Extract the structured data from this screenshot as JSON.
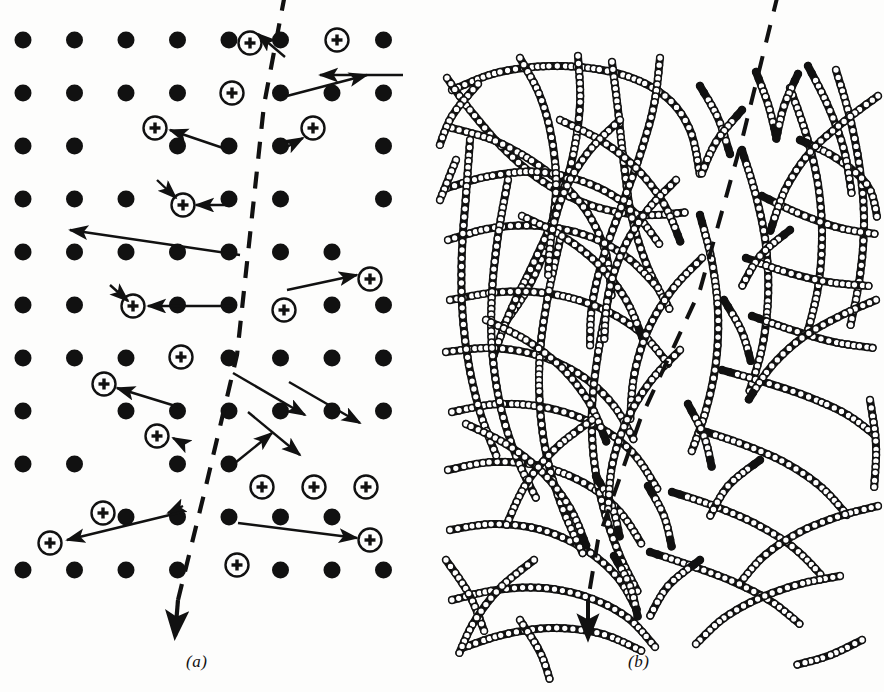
{
  "figure": {
    "background_color": "#fdfdfc",
    "ink_color": "#111111",
    "width": 884,
    "height": 692
  },
  "panels": [
    {
      "id": "a",
      "caption": "(a)",
      "caption_x": 186,
      "caption_y": 652,
      "kind": "crystalline-lattice",
      "description": "Regular square lattice of filled atoms, with circled-plus defect atoms and displacement arrows, bisected by a dashed crack line",
      "lattice": {
        "origin_x": 23,
        "origin_y": 40,
        "spacing_x": 51.5,
        "spacing_y": 53.0,
        "cols": 8,
        "rows": 11,
        "dot_radius": 8.5,
        "dot_fill": "#111111",
        "row_offsets": [
          0,
          0,
          0,
          0,
          0,
          0,
          0,
          0,
          0,
          0,
          0
        ]
      },
      "defect_symbol": {
        "name": "circled-plus",
        "outer_radius": 11.5,
        "stroke_width": 2.4,
        "inner_plus_arm": 5.5,
        "inner_plus_width": 3.4
      },
      "defects": [
        {
          "col": 6,
          "row": 0,
          "x": 337,
          "y": 40
        },
        {
          "col": 4,
          "row": 1,
          "x": 232,
          "y": 93
        },
        {
          "col": 2,
          "row": 2,
          "x": 155,
          "y": 128
        },
        {
          "col": 6,
          "row": 2,
          "x": 313,
          "y": 128
        },
        {
          "col": 3,
          "row": 3,
          "x": 183,
          "y": 205
        },
        {
          "col": 7,
          "row": 4,
          "x": 370,
          "y": 279
        },
        {
          "col": 2,
          "row": 5,
          "x": 133,
          "y": 306
        },
        {
          "col": 5,
          "row": 5,
          "x": 284,
          "y": 310
        },
        {
          "col": 3,
          "row": 6,
          "x": 181,
          "y": 357
        },
        {
          "col": 1,
          "row": 7,
          "x": 104,
          "y": 384
        },
        {
          "col": 2,
          "row": 8,
          "x": 157,
          "y": 436
        },
        {
          "col": 5,
          "row": 8,
          "x": 262,
          "y": 487
        },
        {
          "col": 6,
          "row": 8,
          "x": 314,
          "y": 487
        },
        {
          "col": 7,
          "row": 8,
          "x": 366,
          "y": 487
        },
        {
          "col": 1,
          "row": 9,
          "x": 103,
          "y": 513
        },
        {
          "col": 7,
          "row": 9,
          "x": 370,
          "y": 540
        },
        {
          "col": 0,
          "row": 9,
          "x": 50,
          "y": 543
        },
        {
          "col": 4,
          "row": 10,
          "x": 237,
          "y": 565
        },
        {
          "col": 6,
          "row": 3,
          "x": 250,
          "y": 43
        }
      ],
      "arrows": [
        {
          "x1": 285,
          "y1": 57,
          "x2": 258,
          "y2": 34,
          "label": "displacement-arrow"
        },
        {
          "x1": 403,
          "y1": 75,
          "x2": 320,
          "y2": 75,
          "label": "displacement-arrow"
        },
        {
          "x1": 283,
          "y1": 97,
          "x2": 367,
          "y2": 75,
          "label": "displacement-arrow"
        },
        {
          "x1": 226,
          "y1": 149,
          "x2": 170,
          "y2": 130,
          "label": "displacement-arrow"
        },
        {
          "x1": 285,
          "y1": 148,
          "x2": 303,
          "y2": 138,
          "label": "displacement-arrow"
        },
        {
          "x1": 232,
          "y1": 205,
          "x2": 196,
          "y2": 205,
          "label": "displacement-arrow"
        },
        {
          "x1": 157,
          "y1": 180,
          "x2": 176,
          "y2": 198,
          "label": "displacement-arrow"
        },
        {
          "x1": 240,
          "y1": 255,
          "x2": 70,
          "y2": 230,
          "label": "long-displacement-arrow"
        },
        {
          "x1": 287,
          "y1": 290,
          "x2": 357,
          "y2": 275,
          "label": "displacement-arrow"
        },
        {
          "x1": 232,
          "y1": 306,
          "x2": 148,
          "y2": 306,
          "label": "displacement-arrow"
        },
        {
          "x1": 110,
          "y1": 285,
          "x2": 128,
          "y2": 301,
          "label": "displacement-arrow"
        },
        {
          "x1": 289,
          "y1": 382,
          "x2": 360,
          "y2": 423,
          "label": "displacement-arrow"
        },
        {
          "x1": 182,
          "y1": 408,
          "x2": 117,
          "y2": 388,
          "label": "displacement-arrow"
        },
        {
          "x1": 235,
          "y1": 463,
          "x2": 272,
          "y2": 433,
          "label": "displacement-arrow"
        },
        {
          "x1": 184,
          "y1": 444,
          "x2": 173,
          "y2": 438,
          "label": "displacement-arrow"
        },
        {
          "x1": 183,
          "y1": 506,
          "x2": 168,
          "y2": 513,
          "label": "displacement-arrow"
        },
        {
          "x1": 182,
          "y1": 512,
          "x2": 67,
          "y2": 540,
          "label": "displacement-arrow"
        },
        {
          "x1": 238,
          "y1": 523,
          "x2": 357,
          "y2": 538,
          "label": "displacement-arrow"
        },
        {
          "x1": 233,
          "y1": 373,
          "x2": 305,
          "y2": 415,
          "label": "displacement-arrow"
        },
        {
          "x1": 248,
          "y1": 412,
          "x2": 300,
          "y2": 455,
          "label": "displacement-arrow"
        }
      ],
      "crack_line": {
        "name": "crack-dashed-line",
        "points": [
          [
            285,
            -6
          ],
          [
            264,
            105
          ],
          [
            250,
            235
          ],
          [
            237,
            355
          ],
          [
            205,
            490
          ],
          [
            178,
            600
          ]
        ],
        "arrow_tip": [
          175,
          636
        ],
        "dash": "17 13",
        "stroke_width": 4.2
      }
    },
    {
      "id": "b",
      "caption": "(b)",
      "caption_x": 628,
      "caption_y": 652,
      "kind": "amorphous-polymer-network",
      "description": "Entangled bead-chain polymer strands with black bead chain-ends, bisected by a dashed crack line",
      "bead": {
        "radius": 3.4,
        "spacing": 5.6,
        "fill": "#ffffff",
        "stroke": "#111111",
        "stroke_width": 1.5,
        "end_fill": "#111111"
      },
      "crack_line": {
        "name": "crack-dashed-line",
        "points": [
          [
            778,
            -6
          ],
          [
            742,
            140
          ],
          [
            700,
            290
          ],
          [
            640,
            420
          ],
          [
            598,
            540
          ],
          [
            588,
            600
          ]
        ],
        "arrow_tip": [
          588,
          638
        ],
        "dash": "18 14",
        "stroke_width": 4.0
      }
    }
  ]
}
